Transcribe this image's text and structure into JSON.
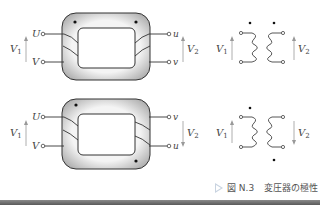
{
  "figure": {
    "caption_prefix": "図 N.3",
    "caption_title": "変圧器の極性",
    "caption_icon": "triangle-right-icon"
  },
  "diagrams": [
    {
      "id": "top",
      "core": {
        "primary_terminals": [
          "U",
          "V"
        ],
        "secondary_terminals": [
          "u",
          "v"
        ],
        "primary_voltage": "V1",
        "secondary_voltage": "V2",
        "secondary_voltage_arrow": "up",
        "polarity_dots": [
          "top-left",
          "top-right"
        ]
      },
      "schematic": {
        "primary_voltage": "V1",
        "secondary_voltage": "V2",
        "secondary_voltage_arrow": "up",
        "polarity_dots": [
          "primary-top",
          "secondary-top"
        ]
      }
    },
    {
      "id": "bottom",
      "core": {
        "primary_terminals": [
          "U",
          "V"
        ],
        "secondary_terminals": [
          "v",
          "u"
        ],
        "primary_voltage": "V1",
        "secondary_voltage": "V2",
        "secondary_voltage_arrow": "down",
        "polarity_dots": [
          "top-left",
          "bottom-right"
        ]
      },
      "schematic": {
        "primary_voltage": "V1",
        "secondary_voltage": "V2",
        "secondary_voltage_arrow": "down",
        "polarity_dots": [
          "primary-top",
          "secondary-bottom"
        ]
      }
    }
  ],
  "labels": {
    "U": "U",
    "V": "V",
    "u": "u",
    "v": "v",
    "V1_main": "V",
    "V1_sub": "1",
    "V2_main": "V",
    "V2_sub": "2"
  }
}
